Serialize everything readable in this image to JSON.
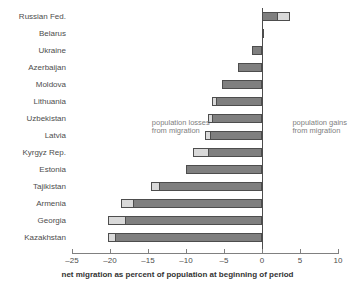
{
  "chart_data": {
    "type": "bar",
    "orientation": "horizontal",
    "title": "",
    "xlabel": "net migration as percent of population at beginning of period",
    "ylabel": "",
    "xlim": [
      -25,
      10
    ],
    "xticks": [
      -25,
      -20,
      -15,
      -10,
      -5,
      0,
      5,
      10
    ],
    "xticklabels": [
      "–25",
      "–20",
      "–15",
      "–10",
      "–5",
      "0",
      "5",
      "10"
    ],
    "grid": false,
    "legend_position": "none",
    "categories": [
      "Russian Fed.",
      "Belarus",
      "Ukraine",
      "Azerbaijan",
      "Moldova",
      "Lithuania",
      "Uzbekistan",
      "Latvia",
      "Kyrgyz Rep.",
      "Estonia",
      "Tajikistan",
      "Armenia",
      "Georgia",
      "Kazakhstan"
    ],
    "series": [
      {
        "name": "dark segment",
        "color": "#7f7f7f",
        "values": [
          2.1,
          0.3,
          -1.3,
          -3.2,
          -5.3,
          -6.0,
          -6.6,
          -6.8,
          -7.1,
          -10.0,
          -13.5,
          -17.0,
          -18.0,
          -19.3
        ]
      },
      {
        "name": "light segment",
        "color": "#d9d9d9",
        "values": [
          3.7,
          0.3,
          -1.3,
          -3.2,
          -5.3,
          -6.6,
          -7.1,
          -7.5,
          -9.1,
          -10.0,
          -14.6,
          -18.5,
          -20.2,
          -20.3
        ]
      }
    ],
    "totals": [
      3.7,
      0.3,
      -1.3,
      -3.2,
      -5.3,
      -6.6,
      -7.1,
      -7.5,
      -9.1,
      -10.0,
      -14.6,
      -18.5,
      -20.2,
      -20.3
    ],
    "annotations": [
      {
        "text": "population losses\nfrom migration",
        "x": -14.5,
        "y": 6.5
      },
      {
        "text": "population gains\nfrom migration",
        "x": 4.0,
        "y": 6.5
      }
    ]
  },
  "colors": {
    "dark_segment": "#7f7f7f",
    "light_segment": "#d9d9d9",
    "bar_outline": "#4d4d4d",
    "axis": "#808080",
    "text": "#4d4d4d",
    "annotation_text": "#808080",
    "background": "#ffffff"
  }
}
